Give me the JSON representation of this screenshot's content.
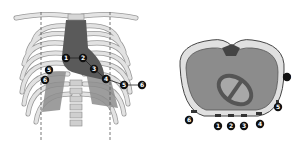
{
  "figures": {
    "left": {
      "title": "Anterior chest with rib cage and heart",
      "markers": [
        {
          "label": "1",
          "x": 66,
          "y": 58
        },
        {
          "label": "2",
          "x": 83,
          "y": 58
        },
        {
          "label": "3",
          "x": 94,
          "y": 69
        },
        {
          "label": "4",
          "x": 106,
          "y": 79
        },
        {
          "label": "5",
          "x": 124,
          "y": 85
        },
        {
          "label": "6",
          "x": 142,
          "y": 85
        },
        {
          "label": "5",
          "x": 49,
          "y": 70
        },
        {
          "label": "6",
          "x": 45,
          "y": 80
        }
      ]
    },
    "right": {
      "title": "Transverse chest cross-section",
      "markers": [
        {
          "label": "1",
          "x": 218,
          "y": 126
        },
        {
          "label": "2",
          "x": 231,
          "y": 126
        },
        {
          "label": "3",
          "x": 244,
          "y": 126
        },
        {
          "label": "4",
          "x": 260,
          "y": 124
        },
        {
          "label": "5",
          "x": 278,
          "y": 107
        },
        {
          "label": "6",
          "x": 287,
          "y": 77
        },
        {
          "label": "6",
          "x": 189,
          "y": 120
        }
      ]
    }
  },
  "colors": {
    "bone": "#e0e0e0",
    "bone_stroke": "#8a8a8a",
    "heart_dark": "#555555",
    "heart_mid": "#6f6f6f",
    "tissue": "#8c8c8c",
    "marker": "#111111"
  }
}
